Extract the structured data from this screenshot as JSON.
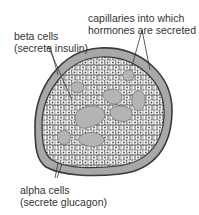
{
  "labels": {
    "capillaries": {
      "line1": "capillaries into which",
      "line2": "hormones are secreted"
    },
    "beta": {
      "line1": "beta cells",
      "line2": "(secrete insulin)"
    },
    "alpha": {
      "line1": "alpha cells",
      "line2": "(secrete glucagon)"
    }
  },
  "colors": {
    "outline": "#3a3a3a",
    "capsule": "#a8a8a8",
    "capillary": "#b4b4b4",
    "cell_fill": "#ffffff",
    "text": "#333333"
  }
}
